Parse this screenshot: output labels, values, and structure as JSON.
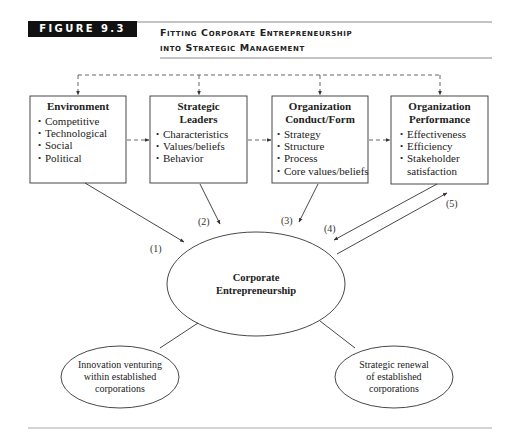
{
  "header": {
    "figure_label": "FIGURE 9.3",
    "title_line1": "Fitting Corporate Entrepreneurship",
    "title_line2": "into Strategic Management"
  },
  "boxes": [
    {
      "title_lines": [
        "Environment"
      ],
      "items": [
        "Competitive",
        "Technological",
        "Social",
        "Political"
      ]
    },
    {
      "title_lines": [
        "Strategic",
        "Leaders"
      ],
      "items": [
        "Characteristics",
        "Values/beliefs",
        "Behavior"
      ]
    },
    {
      "title_lines": [
        "Organization",
        "Conduct/Form"
      ],
      "items": [
        "Strategy",
        "Structure",
        "Process",
        "Core values/beliefs"
      ]
    },
    {
      "title_lines": [
        "Organization",
        "Performance"
      ],
      "items": [
        "Effectiveness",
        "Efficiency",
        "Stakeholder",
        "satisfaction"
      ]
    }
  ],
  "arrow_labels": [
    "(1)",
    "(2)",
    "(3)",
    "(4)",
    "(5)"
  ],
  "center_node": {
    "line1": "Corporate",
    "line2": "Entrepreneurship"
  },
  "left_node": {
    "line1": "Innovation venturing",
    "line2": "within established",
    "line3": "corporations"
  },
  "right_node": {
    "line1": "Strategic renewal",
    "line2": "of established",
    "line3": "corporations"
  },
  "colors": {
    "ink": "#222222",
    "rule": "#888888",
    "label_bg": "#111111"
  }
}
